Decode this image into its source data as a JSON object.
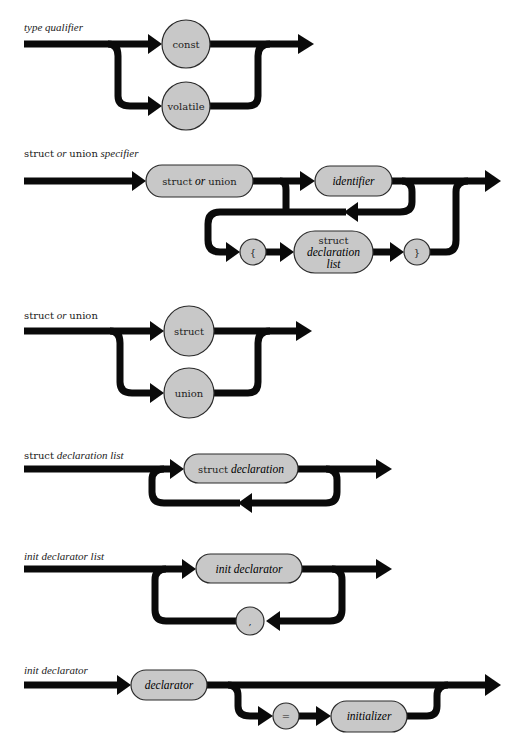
{
  "diagrams": [
    {
      "title": {
        "parts": [
          "type qualifier"
        ],
        "styles": [
          "italic"
        ]
      },
      "nodes": [
        {
          "shape": "circle",
          "text": "const"
        },
        {
          "shape": "circle",
          "text": "volatile"
        }
      ]
    },
    {
      "title": {
        "parts": [
          "struct",
          " or ",
          "union",
          " specifier"
        ],
        "styles": [
          "roman",
          "italic",
          "roman",
          "italic"
        ]
      },
      "nodes": [
        {
          "shape": "pill",
          "text_parts": [
            "struct",
            " or ",
            "union"
          ]
        },
        {
          "shape": "pill",
          "text": "identifier",
          "italic": true
        },
        {
          "shape": "circle",
          "text": "{"
        },
        {
          "shape": "pill",
          "text_lines": [
            "struct",
            "declaration",
            "list"
          ]
        },
        {
          "shape": "circle",
          "text": "}"
        }
      ]
    },
    {
      "title": {
        "parts": [
          "struct",
          " or ",
          "union"
        ],
        "styles": [
          "roman",
          "italic",
          "roman"
        ]
      },
      "nodes": [
        {
          "shape": "circle",
          "text": "struct"
        },
        {
          "shape": "circle",
          "text": "union"
        }
      ]
    },
    {
      "title": {
        "parts": [
          "struct",
          " declaration list"
        ],
        "styles": [
          "roman",
          "italic"
        ]
      },
      "nodes": [
        {
          "shape": "pill",
          "text_parts": [
            "struct",
            " declaration"
          ]
        }
      ]
    },
    {
      "title": {
        "parts": [
          "init declarator list"
        ],
        "styles": [
          "italic"
        ]
      },
      "nodes": [
        {
          "shape": "pill",
          "text": "init declarator",
          "italic": true
        },
        {
          "shape": "circle",
          "text": ","
        }
      ]
    },
    {
      "title": {
        "parts": [
          "init declarator"
        ],
        "styles": [
          "italic"
        ]
      },
      "nodes": [
        {
          "shape": "pill",
          "text": "declarator",
          "italic": true
        },
        {
          "shape": "circle",
          "text": "="
        },
        {
          "shape": "pill",
          "text": "initializer",
          "italic": true
        }
      ]
    }
  ],
  "colors": {
    "track": "#0a0a0a",
    "node_fill": "#c8c8c8",
    "node_stroke": "#2a2a2a",
    "background": "#ffffff"
  }
}
